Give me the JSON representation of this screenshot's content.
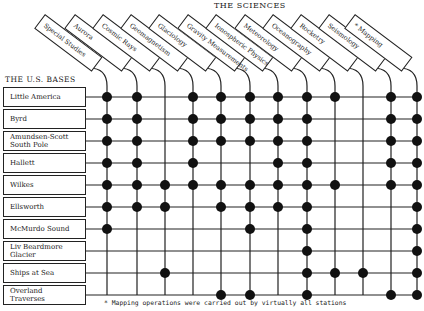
{
  "title": "THE SCIENCES",
  "bases_title": "THE U.S. BASES",
  "footnote": "* Mapping operations were carried out by virtually all stations",
  "sciences": [
    "Special Studies",
    "Aurora",
    "Cosmic Rays",
    "Geomagnetism",
    "Glaciology",
    "Gravity Measurements",
    "Ionospheric Physics",
    "Meteorology",
    "Oceanography",
    "Rocketry",
    "Seismology",
    "* Mapping"
  ],
  "bases": [
    {
      "label": "Little America",
      "dots": [
        0,
        1,
        3,
        4,
        5,
        6,
        7,
        8,
        10,
        11
      ]
    },
    {
      "label": "Byrd",
      "dots": [
        0,
        1,
        3,
        4,
        5,
        6,
        7,
        10,
        11
      ]
    },
    {
      "label": "Amundsen-Scott South Pole",
      "dots": [
        0,
        1,
        3,
        4,
        5,
        6,
        7,
        10,
        11
      ]
    },
    {
      "label": "Hallett",
      "dots": [
        0,
        1,
        3,
        6,
        7,
        10,
        11
      ]
    },
    {
      "label": "Wilkes",
      "dots": [
        0,
        1,
        2,
        3,
        4,
        5,
        6,
        7,
        8,
        10,
        11
      ]
    },
    {
      "label": "Ellsworth",
      "dots": [
        0,
        1,
        2,
        4,
        5,
        6,
        7,
        11
      ]
    },
    {
      "label": "McMurdo Sound",
      "dots": [
        0,
        5,
        7,
        11
      ]
    },
    {
      "label": "Liv Beardmore Glacier",
      "dots": [
        7,
        11
      ]
    },
    {
      "label": "Ships at Sea",
      "dots": [
        2,
        7,
        8,
        9,
        11
      ]
    },
    {
      "label": "Overland Traverses",
      "dots": [
        4,
        5,
        7,
        10,
        11
      ]
    }
  ],
  "chart_data": {
    "type": "table",
    "title": "THE SCIENCES",
    "columns": [
      "Special Studies",
      "Aurora",
      "Cosmic Rays",
      "Geomagnetism",
      "Glaciology",
      "Gravity Measurements",
      "Ionospheric Physics",
      "Meteorology",
      "Oceanography",
      "Rocketry",
      "Seismology",
      "* Mapping"
    ],
    "rows": [
      "Little America",
      "Byrd",
      "Amundsen-Scott South Pole",
      "Hallett",
      "Wilkes",
      "Ellsworth",
      "McMurdo Sound",
      "Liv Beardmore Glacier",
      "Ships at Sea",
      "Overland Traverses"
    ],
    "matrix": [
      [
        1,
        1,
        0,
        1,
        1,
        1,
        1,
        1,
        1,
        0,
        1,
        1
      ],
      [
        1,
        1,
        0,
        1,
        1,
        1,
        1,
        1,
        0,
        0,
        1,
        1
      ],
      [
        1,
        1,
        0,
        1,
        1,
        1,
        1,
        1,
        0,
        0,
        1,
        1
      ],
      [
        1,
        1,
        0,
        1,
        0,
        0,
        1,
        1,
        0,
        0,
        1,
        1
      ],
      [
        1,
        1,
        1,
        1,
        1,
        1,
        1,
        1,
        1,
        0,
        1,
        1
      ],
      [
        1,
        1,
        1,
        0,
        1,
        1,
        1,
        1,
        0,
        0,
        0,
        1
      ],
      [
        1,
        0,
        0,
        0,
        0,
        1,
        0,
        1,
        0,
        0,
        0,
        1
      ],
      [
        0,
        0,
        0,
        0,
        0,
        0,
        0,
        1,
        0,
        0,
        0,
        1
      ],
      [
        0,
        0,
        1,
        0,
        0,
        0,
        0,
        1,
        1,
        1,
        0,
        1
      ],
      [
        0,
        0,
        0,
        0,
        1,
        1,
        0,
        1,
        0,
        0,
        1,
        1
      ]
    ],
    "note": "* Mapping operations were carried out by virtually all stations"
  }
}
